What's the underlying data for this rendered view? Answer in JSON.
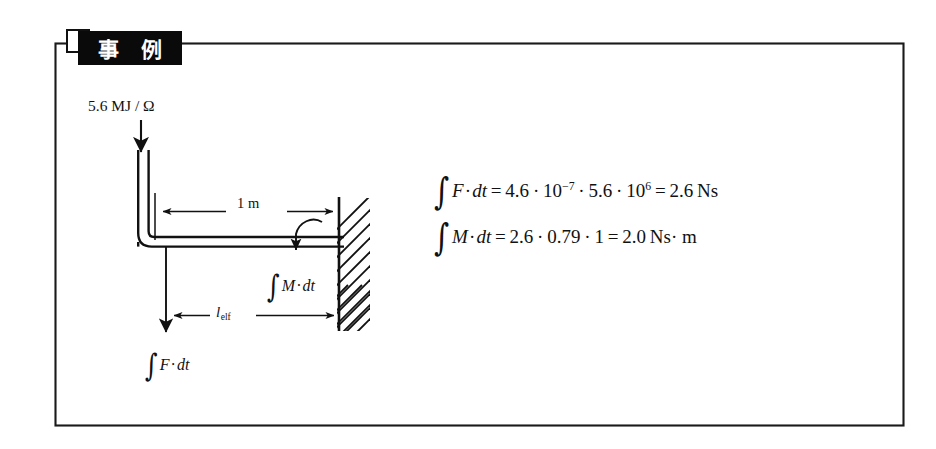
{
  "figure": {
    "badge_label": "事 例",
    "badge_meaning": "Example",
    "source_label": "5.6 MJ / Ω",
    "dimension_top_label": "1 m",
    "dimension_bottom_label": "l",
    "dimension_bottom_subscript": "elf",
    "moment_arrow_label_prefix": "M",
    "moment_arrow_label": "∫M·dt",
    "force_arrow_label": "∫F·dt",
    "equations": [
      {
        "id": "impulse",
        "integrand": "F",
        "differential": "dt",
        "rhs_a": "4.6",
        "rhs_a_power_base": "10",
        "rhs_a_power_exp": "−7",
        "rhs_b": "5.6",
        "rhs_b_power_base": "10",
        "rhs_b_power_exp": "6",
        "result": "2.6",
        "unit": "Ns",
        "plain": "∫F·dt = 4.6 · 10⁻⁷ · 5.6 · 10⁶ = 2.6 Ns"
      },
      {
        "id": "angular-impulse",
        "integrand": "M",
        "differential": "dt",
        "factor_1": "2.6",
        "factor_2": "0.79",
        "factor_3": "1",
        "result": "2.0",
        "unit": "Ns· m",
        "plain": "∫M·dt = 2.6 · 0.79 · 1 = 2.0 Ns· m"
      }
    ],
    "colors": {
      "ink": "#111111",
      "badge_background": "#0a0a0a",
      "badge_text": "#ffffff",
      "page_background": "#ffffff"
    }
  }
}
